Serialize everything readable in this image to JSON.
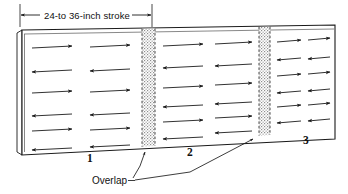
{
  "figure": {
    "background_color": "#ffffff",
    "line_color": "#1a1a1a",
    "hatch_color": "#9a9a9a",
    "arrow_color": "#1a1a1a"
  },
  "dimension": {
    "label": "24-to 36-inch stroke",
    "left_tick_x": 20,
    "right_tick_x": 152,
    "line_y": 15,
    "arrow_style": "double-ended"
  },
  "panel": {
    "top_left": [
      22,
      30
    ],
    "top_right": [
      335,
      25
    ],
    "bottom_right": [
      335,
      139
    ],
    "bottom_left": [
      22,
      155
    ],
    "edge_thickness_px": 5,
    "inner_inset_px": 3
  },
  "overlap_bands": [
    {
      "id": "overlap-band-1",
      "x_center": 148,
      "width": 13,
      "fill": "stipple",
      "border": "dashed"
    },
    {
      "id": "overlap-band-2",
      "x_center": 264,
      "width": 11,
      "fill": "stipple",
      "border": "dashed"
    }
  ],
  "sections": [
    {
      "id": "section-1",
      "number": "1",
      "label_x": 90,
      "label_y": 158,
      "columns": 2,
      "rows": 6
    },
    {
      "id": "section-2",
      "number": "2",
      "label_x": 190,
      "label_y": 152,
      "columns": 2,
      "rows": 6
    },
    {
      "id": "section-3",
      "number": "3",
      "label_x": 306,
      "label_y": 140,
      "columns": 2,
      "rows": 6
    }
  ],
  "arrow_pattern": {
    "description": "Alternating horizontal spray strokes, right then left on successive rows",
    "row_directions": [
      "right",
      "left",
      "right",
      "left",
      "right",
      "left"
    ],
    "rows": 6,
    "columns_per_section": 2
  },
  "callout": {
    "label": "Overlap",
    "text_x": 96,
    "text_y": 184,
    "leader_targets": [
      [
        145,
        150
      ],
      [
        252,
        136
      ]
    ]
  }
}
